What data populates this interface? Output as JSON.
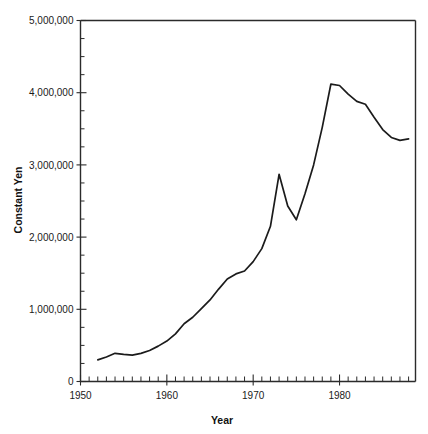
{
  "chart_data": {
    "type": "line",
    "title": "",
    "xlabel": "Year",
    "ylabel": "Constant Yen",
    "xlim": [
      1950,
      1988.8
    ],
    "ylim": [
      0,
      5000000
    ],
    "grid": false,
    "legend": null,
    "x_major_ticks": [
      1950,
      1960,
      1970,
      1980
    ],
    "x_major_tick_labels": [
      "1950",
      "1960",
      "1970",
      "1980"
    ],
    "x_minor_tick_interval": 1,
    "y_major_ticks": [
      0,
      1000000,
      2000000,
      3000000,
      4000000,
      5000000
    ],
    "y_major_tick_labels": [
      "0",
      "1,000,000",
      "2,000,000",
      "3,000,000",
      "4,000,000",
      "5,000,000"
    ],
    "y_minor_tick_interval": 250000,
    "series": [
      {
        "name": "Constant Yen",
        "color": "#1b1b1b",
        "x": [
          1952,
          1953,
          1954,
          1955,
          1956,
          1957,
          1958,
          1959,
          1960,
          1961,
          1962,
          1963,
          1964,
          1965,
          1966,
          1967,
          1968,
          1969,
          1970,
          1971,
          1972,
          1973,
          1974,
          1975,
          1976,
          1977,
          1978,
          1979,
          1980,
          1981,
          1982,
          1983,
          1984,
          1985,
          1986,
          1987,
          1988
        ],
        "values": [
          300000,
          340000,
          390000,
          375000,
          365000,
          390000,
          430000,
          490000,
          560000,
          660000,
          800000,
          890000,
          1010000,
          1130000,
          1280000,
          1420000,
          1490000,
          1530000,
          1660000,
          1840000,
          2150000,
          2870000,
          2430000,
          2240000,
          2600000,
          3000000,
          3520000,
          4120000,
          4100000,
          3980000,
          3880000,
          3840000,
          3660000,
          3490000,
          3380000,
          3340000,
          3360000
        ]
      }
    ]
  },
  "axes": {
    "y_axis_title": "Constant Yen",
    "x_axis_title": "Year"
  }
}
